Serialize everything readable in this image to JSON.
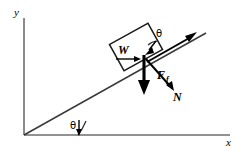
{
  "figure": {
    "background_color": "#ffffff",
    "line_color": "#000000",
    "axis_color": "#6e6e6e"
  },
  "axes": {
    "y_label": "y",
    "x_label": "x",
    "origin": {
      "x": 24,
      "y": 135
    },
    "y_axis": {
      "x": 24,
      "y_top": 18,
      "y_bottom": 135
    },
    "x_axis": {
      "y": 135,
      "x_left": 24,
      "x_right": 230
    }
  },
  "incline": {
    "name": "inclined-plane-surface",
    "start": {
      "x": 24,
      "y": 135
    },
    "end": {
      "x": 206,
      "y": 33
    },
    "angle_label": "θ",
    "angle_degrees": 29
  },
  "block": {
    "name": "block-on-incline",
    "center": {
      "x": 136,
      "y": 47
    },
    "width": 44,
    "height": 30,
    "rotation_degrees": -29,
    "angle_label": "θ"
  },
  "vectors": [
    {
      "id": "weight",
      "label": "W",
      "description": "Weight vector pointing vertically downward",
      "origin": {
        "x": 145,
        "y": 57
      },
      "tip": {
        "x": 145,
        "y": 93
      },
      "label_position": {
        "x": 122,
        "y": 52
      },
      "style": "heavy"
    },
    {
      "id": "normal",
      "label": "N",
      "description": "Normal force vector perpendicular to incline surface",
      "origin": {
        "x": 146,
        "y": 60
      },
      "tip": {
        "x": 175,
        "y": 92
      },
      "label_position": {
        "x": 176,
        "y": 99
      },
      "style": "medium"
    },
    {
      "id": "friction",
      "label": "F",
      "sublabel": "f",
      "description": "Friction force vector directed up along the incline",
      "origin": {
        "x": 146,
        "y": 61
      },
      "tip": {
        "x": 196,
        "y": 33
      },
      "label_position": {
        "x": 162,
        "y": 76
      },
      "style": "medium"
    },
    {
      "id": "horizontal-component",
      "label": "",
      "description": "Short horizontal arrow pointing right near W",
      "origin": {
        "x": 117,
        "y": 58
      },
      "tip": {
        "x": 140,
        "y": 58
      },
      "style": "thin"
    }
  ],
  "angles": [
    {
      "id": "base-angle",
      "label": "θ",
      "label_position": {
        "x": 74,
        "y": 126
      },
      "vertex": {
        "x": 24,
        "y": 135
      },
      "description": "Incline angle between plane and horizontal x-axis"
    },
    {
      "id": "block-angle",
      "label": "θ",
      "label_position": {
        "x": 158,
        "y": 35
      },
      "description": "Angle between weight vector and normal direction at block"
    }
  ]
}
